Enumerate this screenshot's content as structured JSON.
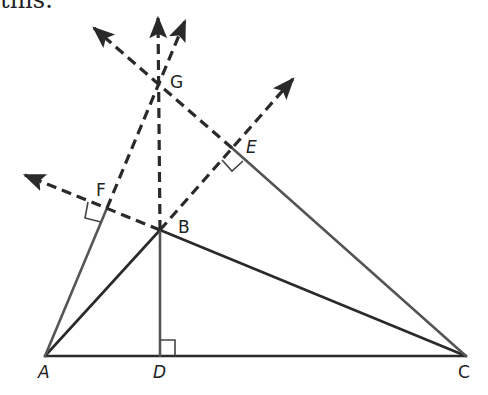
{
  "caption": "this:",
  "colors": {
    "stroke": "#2a2a2a",
    "background": "#ffffff"
  },
  "points": {
    "A": {
      "label": "A",
      "x": 45,
      "y": 356
    },
    "D": {
      "label": "D",
      "x": 160,
      "y": 356
    },
    "C": {
      "label": "C",
      "x": 466,
      "y": 356
    },
    "B": {
      "label": "B",
      "x": 160,
      "y": 230
    },
    "G": {
      "label": "G",
      "x": 160,
      "y": 85
    },
    "F": {
      "label": "F",
      "x": 107,
      "y": 208
    },
    "E": {
      "label": "E",
      "x": 232,
      "y": 148
    }
  },
  "segments_solid": [
    "A-C",
    "A-B",
    "B-C",
    "A-F",
    "B-D",
    "E-C"
  ],
  "rays_dashed": [
    "B-G extended up",
    "F-G extended up",
    "E-G extended upper-left",
    "B-F extended left",
    "B-E extended upper-right"
  ],
  "right_angle_marks": [
    "D",
    "F",
    "E"
  ]
}
